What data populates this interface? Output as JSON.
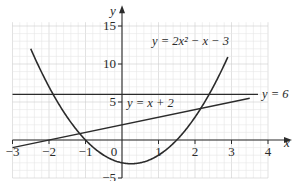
{
  "chart_data": {
    "type": "line",
    "title": "",
    "xlabel": "x",
    "ylabel": "y",
    "xlim": [
      -3,
      4
    ],
    "ylim": [
      -5,
      15.5
    ],
    "grid": true,
    "x_ticks": [
      -3,
      -2,
      -1,
      0,
      1,
      2,
      3,
      4
    ],
    "x_tick_labels": [
      "−3",
      "−2",
      "−1",
      "0",
      "1",
      "2",
      "3",
      "4"
    ],
    "y_ticks": [
      -5,
      5,
      10,
      15
    ],
    "y_tick_labels": [
      "−5",
      "5",
      "10",
      "15"
    ],
    "series": [
      {
        "name": "y = 2x² − x − 3",
        "equation": "2*x^2 - x - 3",
        "x_range": [
          -2.5,
          2.9
        ],
        "x": [
          -2.5,
          -2,
          -1.5,
          -1,
          -0.5,
          0,
          0.25,
          0.5,
          1,
          1.5,
          2,
          2.5,
          2.9
        ],
        "y": [
          14.5,
          7,
          3,
          0,
          -2,
          -3,
          -3.125,
          -3,
          -2,
          0,
          3,
          7,
          10.9
        ]
      },
      {
        "name": "y = x + 2",
        "equation": "x + 2",
        "x_range": [
          -3,
          3.5
        ],
        "x": [
          -3,
          3.5
        ],
        "y": [
          -1,
          5.5
        ]
      },
      {
        "name": "y = 6",
        "equation": "6",
        "x_range": [
          -3,
          4
        ],
        "x": [
          -3,
          4
        ],
        "y": [
          6,
          6
        ]
      }
    ],
    "annotations": [
      "y = 2x² − x − 3",
      "y = x + 2",
      "y = 6"
    ]
  },
  "labels": {
    "axis_x": "x",
    "axis_y": "y",
    "origin": "0",
    "curve_label": "y = 2x² − x − 3",
    "line_label": "y = x + 2",
    "hline_label": "y = 6"
  },
  "colors": {
    "curve": "#2b2b2b",
    "axis": "#2b2b2b",
    "grid_minor": "#e6e6e6",
    "grid_major": "#cfcfcf",
    "background": "#ffffff"
  }
}
